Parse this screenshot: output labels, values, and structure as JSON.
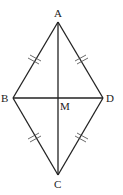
{
  "diagram": {
    "type": "rhombus",
    "vertices": [
      {
        "name": "A",
        "x": 58,
        "y": 22
      },
      {
        "name": "B",
        "x": 13,
        "y": 98
      },
      {
        "name": "D",
        "x": 103,
        "y": 98
      },
      {
        "name": "C",
        "x": 58,
        "y": 175
      }
    ],
    "labels": {
      "A": "A",
      "B": "B",
      "C": "C",
      "D": "D",
      "M": "M"
    },
    "midpoint": {
      "name": "M",
      "x": 58,
      "y": 98
    },
    "edges": [
      "AB",
      "AD",
      "BC",
      "DC"
    ],
    "diagonals": [
      "AC",
      "BD"
    ],
    "equal_marks": "double tick on each side (AB = AD = BC = DC)",
    "stroke_color": "#222222"
  }
}
